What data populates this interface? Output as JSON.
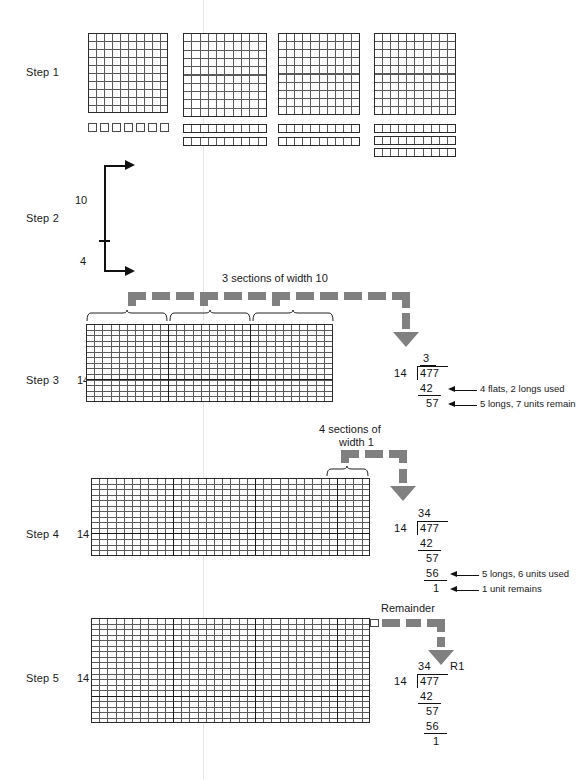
{
  "figure": {
    "topic": "Long division with base-ten blocks: 477 divided by 14",
    "dividend": "477",
    "divisor": "14",
    "quotient": "34",
    "remainder": "1"
  },
  "steps": [
    {
      "id": "step1",
      "label": "Step 1"
    },
    {
      "id": "step2",
      "label": "Step 2"
    },
    {
      "id": "step3",
      "label": "Step 3"
    },
    {
      "id": "step4",
      "label": "Step 4"
    },
    {
      "id": "step5",
      "label": "Step 5"
    }
  ],
  "step1": {
    "label": "Step 1",
    "groups": [
      {
        "flats": 1,
        "longs": 0,
        "units": 7
      },
      {
        "flats": 1,
        "longs": 2,
        "units": 0
      },
      {
        "flats": 1,
        "longs": 2,
        "units": 0
      },
      {
        "flats": 1,
        "longs": 3,
        "units": 0
      }
    ]
  },
  "step2": {
    "label": "Step 2",
    "upper_value": "10",
    "lower_value": "4"
  },
  "step3": {
    "label": "Step 3",
    "height_label": "14",
    "caption": "3 sections of width 10",
    "sections": 3,
    "section_width": 10,
    "grid": {
      "cols": 30,
      "rows": 14
    },
    "division": {
      "quotient": "3",
      "divisor": "14",
      "dividend": "477",
      "subtrahend": "42",
      "difference": "57",
      "note_a": "4 flats, 2 longs used",
      "note_b": "5 longs, 7 units remain"
    }
  },
  "step4": {
    "label": "Step 4",
    "height_label": "14",
    "caption_line1": "4 sections of",
    "caption_line2": "width 1",
    "grid": {
      "cols": 34,
      "rows": 14
    },
    "division": {
      "quotient": "34",
      "divisor": "14",
      "dividend": "477",
      "subtrahend1": "42",
      "difference1": "57",
      "subtrahend2": "56",
      "difference2": "1",
      "note_a": "5 longs, 6 units used",
      "note_b": "1 unit remains"
    }
  },
  "step5": {
    "label": "Step 5",
    "height_label": "14",
    "caption": "Remainder",
    "grid": {
      "cols": 34,
      "rows": 14
    },
    "division": {
      "quotient": "34",
      "remainder_label": "R1",
      "divisor": "14",
      "dividend": "477",
      "subtrahend1": "42",
      "difference1": "57",
      "subtrahend2": "56",
      "difference2": "1"
    }
  },
  "colors": {
    "dash_gray": "#808080",
    "grid_line": "#5a5a5a",
    "outline": "#2b2b2b",
    "text": "#1a1a1a",
    "fold": "#e8e6e2"
  }
}
